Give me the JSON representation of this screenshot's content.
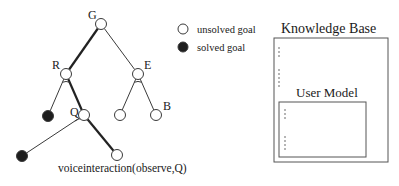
{
  "diagram": {
    "nodes": [
      {
        "id": "G",
        "label": "G",
        "x": 101,
        "y": 24,
        "state": "unsolved",
        "label_dx": -13,
        "label_dy": -5
      },
      {
        "id": "R",
        "label": "R",
        "x": 66,
        "y": 74,
        "state": "unsolved",
        "label_dx": -14,
        "label_dy": -5
      },
      {
        "id": "E",
        "label": "E",
        "x": 138,
        "y": 74,
        "state": "unsolved",
        "label_dx": 6,
        "label_dy": -5
      },
      {
        "id": "R1",
        "label": "",
        "x": 48,
        "y": 116,
        "state": "solved"
      },
      {
        "id": "Q",
        "label": "Q",
        "x": 84,
        "y": 115,
        "state": "unsolved",
        "label_dx": -14,
        "label_dy": 1
      },
      {
        "id": "E1",
        "label": "",
        "x": 120,
        "y": 115,
        "state": "unsolved"
      },
      {
        "id": "B",
        "label": "B",
        "x": 156,
        "y": 115,
        "state": "unsolved",
        "label_dx": 7,
        "label_dy": -5
      },
      {
        "id": "Q1",
        "label": "",
        "x": 22,
        "y": 156,
        "state": "solved"
      },
      {
        "id": "Q2",
        "label": "",
        "x": 117,
        "y": 155,
        "state": "unsolved"
      }
    ],
    "edges": [
      {
        "from": "G",
        "to": "R",
        "bold": true
      },
      {
        "from": "G",
        "to": "E",
        "bold": false
      },
      {
        "from": "R",
        "to": "R1",
        "bold": false
      },
      {
        "from": "R",
        "to": "Q",
        "bold": true
      },
      {
        "from": "E",
        "to": "E1",
        "bold": false
      },
      {
        "from": "E",
        "to": "B",
        "bold": false
      },
      {
        "from": "Q",
        "to": "Q1",
        "bold": false
      },
      {
        "from": "Q",
        "to": "Q2",
        "bold": true
      }
    ],
    "and_arcs": [
      {
        "node": "R",
        "r": 9
      },
      {
        "node": "E",
        "r": 9
      },
      {
        "node": "Q",
        "r": 11
      }
    ],
    "caption": {
      "text": "voiceinteraction(observe,Q)",
      "x": 58,
      "y": 172
    }
  },
  "legend": {
    "items": [
      {
        "label": "unsolved goal",
        "state": "unsolved",
        "x": 183,
        "y": 29
      },
      {
        "label": "solved goal",
        "state": "solved",
        "x": 183,
        "y": 47
      }
    ]
  },
  "knowledge_base": {
    "title": "Knowledge Base",
    "box": {
      "x": 274,
      "y": 38,
      "w": 114,
      "h": 124
    },
    "dots": [
      {
        "x": 279,
        "y": 48
      },
      {
        "x": 279,
        "y": 52
      },
      {
        "x": 279,
        "y": 56
      },
      {
        "x": 279,
        "y": 70
      },
      {
        "x": 279,
        "y": 74
      },
      {
        "x": 279,
        "y": 78
      },
      {
        "x": 279,
        "y": 82
      },
      {
        "x": 279,
        "y": 86
      }
    ],
    "user_model": {
      "title": "User Model",
      "box": {
        "x": 279,
        "y": 102,
        "w": 87,
        "h": 55
      },
      "dots": [
        {
          "x": 285,
          "y": 110
        },
        {
          "x": 285,
          "y": 114
        },
        {
          "x": 285,
          "y": 118
        },
        {
          "x": 285,
          "y": 137
        },
        {
          "x": 285,
          "y": 141
        },
        {
          "x": 285,
          "y": 145
        },
        {
          "x": 285,
          "y": 149
        }
      ]
    }
  },
  "colors": {
    "line": "#3a3a3a",
    "bold_line": "#222222",
    "solved_fill": "#1e1e1e",
    "unsolved_fill": "#ffffff",
    "box_stroke": "#555555"
  }
}
